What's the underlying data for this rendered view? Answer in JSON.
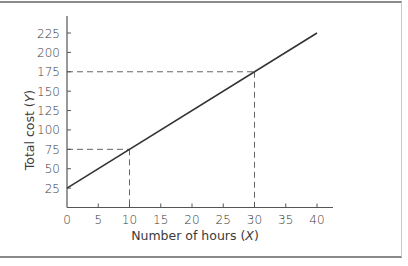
{
  "chart_data": {
    "type": "line",
    "title": "",
    "xlabel": "Number of hours (X)",
    "ylabel": "Total cost (Y)",
    "xlabel_parts": {
      "text": "Number of hours (",
      "var": "X",
      "close": ")"
    },
    "ylabel_parts": {
      "text": "Total cost (",
      "var": "Y",
      "close": ")"
    },
    "xlim": [
      0,
      42
    ],
    "ylim": [
      0,
      240
    ],
    "x_ticks": [
      0,
      5,
      10,
      15,
      20,
      25,
      30,
      35,
      40
    ],
    "y_ticks": [
      25,
      50,
      75,
      100,
      125,
      150,
      175,
      200,
      225
    ],
    "grid": false,
    "legend": null,
    "series": [
      {
        "name": "Total cost",
        "x": [
          0,
          40
        ],
        "y": [
          25,
          225
        ],
        "style": "solid",
        "color": "#333333"
      }
    ],
    "equation": "Y = 25 + 5X",
    "reference_points": [
      {
        "x": 10,
        "y": 75,
        "style": "dashed"
      },
      {
        "x": 30,
        "y": 175,
        "style": "dashed"
      }
    ]
  },
  "colors": {
    "line": "#333333",
    "axis": "#555555",
    "dash": "#666666",
    "text": "#3a3a3a",
    "frame": "#8a8a8a"
  }
}
